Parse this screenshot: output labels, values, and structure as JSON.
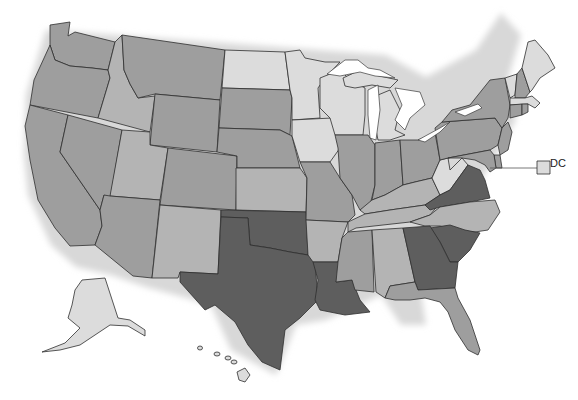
{
  "map": {
    "title": "",
    "type": "choropleth",
    "colors": {
      "level_1_lightest": "#dcdcdc",
      "level_2_light": "#b4b4b4",
      "level_3_medium": "#9e9e9e",
      "level_4_dark": "#5e5e5e",
      "border": "#2e2e2e",
      "background": "#ffffff"
    },
    "callout": {
      "label": "DC",
      "level": 1
    },
    "states": {
      "WA": 3,
      "OR": 3,
      "CA": 3,
      "NV": 3,
      "ID": 2,
      "MT": 3,
      "WY": 3,
      "UT": 2,
      "AZ": 3,
      "CO": 3,
      "NM": 2,
      "ND": 1,
      "SD": 3,
      "NE": 3,
      "KS": 2,
      "OK": 4,
      "TX": 4,
      "MN": 1,
      "IA": 1,
      "MO": 3,
      "AR": 2,
      "LA": 4,
      "WI": 1,
      "IL": 3,
      "MI": 1,
      "IN": 3,
      "OH": 3,
      "KY": 2,
      "TN": 2,
      "MS": 3,
      "AL": 2,
      "WV": 1,
      "VA": 4,
      "NC": 2,
      "SC": 4,
      "GA": 4,
      "FL": 3,
      "PA": 3,
      "NY": 3,
      "VT": 1,
      "NH": 3,
      "ME": 1,
      "MA": 1,
      "RI": 3,
      "CT": 3,
      "NJ": 3,
      "DE": 3,
      "MD": 3,
      "AK": 1,
      "HI": 1,
      "DC": 1
    }
  }
}
